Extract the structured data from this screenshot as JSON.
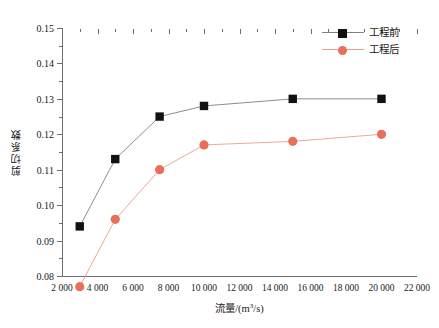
{
  "chart_data": {
    "type": "line",
    "title": "",
    "xlabel": "流量/(m³/s)",
    "ylabel": "剪切系数",
    "xlim": [
      2000,
      22000
    ],
    "ylim": [
      0.08,
      0.15
    ],
    "xticks": [
      2000,
      4000,
      6000,
      8000,
      10000,
      12000,
      14000,
      16000,
      18000,
      20000,
      22000
    ],
    "xtick_labels": [
      "2 000",
      "4 000",
      "6 000",
      "8 000",
      "10 000",
      "12 000",
      "14 000",
      "16 000",
      "18 000",
      "20 000",
      "22 000"
    ],
    "yticks": [
      0.08,
      0.09,
      0.1,
      0.11,
      0.12,
      0.13,
      0.14,
      0.15
    ],
    "ytick_labels": [
      "0.08",
      "0.09",
      "0.10",
      "0.11",
      "0.12",
      "0.13",
      "0.14",
      "0.15"
    ],
    "grid": false,
    "legend_position": "top-right",
    "x": [
      3000,
      5000,
      7500,
      10000,
      15000,
      20000
    ],
    "series": [
      {
        "name": "工程前",
        "color": "#111111",
        "marker": "square",
        "values": [
          0.094,
          0.113,
          0.125,
          0.128,
          0.13,
          0.13
        ]
      },
      {
        "name": "工程后",
        "color": "#E8705A",
        "marker": "circle",
        "values": [
          0.077,
          0.096,
          0.11,
          0.117,
          0.118,
          0.12
        ]
      }
    ]
  },
  "legend": {
    "items": [
      {
        "label": "工程前"
      },
      {
        "label": "工程后"
      }
    ]
  },
  "axis_titles": {
    "x_main": "流量/(m",
    "x_sup": "3",
    "x_tail": "/s)",
    "y": "剪切系数"
  },
  "colors": {
    "series_before": "#111111",
    "series_after": "#E8705A",
    "axis": "#6f6f6f",
    "text": "#1a1a1a",
    "background": "#ffffff"
  }
}
